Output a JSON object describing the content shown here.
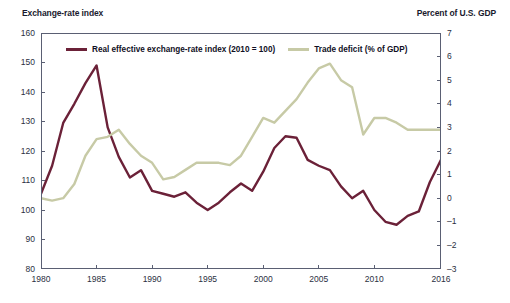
{
  "header": {
    "left_axis_title": "Exchange-rate index",
    "right_axis_title": "Percent of U.S. GDP"
  },
  "legend": {
    "items": [
      {
        "label": "Real effective exchange-rate index (2010 = 100)",
        "color": "#6b2138"
      },
      {
        "label": "Trade deficit (% of GDP)",
        "color": "#c7caa6"
      }
    ]
  },
  "chart_data": {
    "type": "line",
    "title": "",
    "subtitle": "",
    "xlabel": "",
    "ylabel": "Exchange-rate index",
    "y2label": "Percent of U.S. GDP",
    "grid": false,
    "legend_position": "top-inside",
    "xlim": [
      1980,
      2016
    ],
    "ylim": [
      80,
      160
    ],
    "y2lim": [
      -3,
      7
    ],
    "x_ticks": [
      1980,
      1985,
      1990,
      1995,
      2000,
      2005,
      2010,
      2016
    ],
    "x_tick_labels": [
      "1980",
      "1985",
      "1990",
      "1995",
      "2000",
      "2005",
      "2010",
      "2016"
    ],
    "y_ticks": [
      80,
      90,
      100,
      110,
      120,
      130,
      140,
      150,
      160
    ],
    "y_tick_labels": [
      "80",
      "90",
      "100",
      "110",
      "120",
      "130",
      "140",
      "150",
      "160"
    ],
    "y2_ticks": [
      -3,
      -2,
      -1,
      0,
      1,
      2,
      3,
      4,
      5,
      6,
      7
    ],
    "y2_tick_labels": [
      "–3",
      "–2",
      "–1",
      "0",
      "1",
      "2",
      "3",
      "4",
      "5",
      "6",
      "7"
    ],
    "x": [
      1980,
      1981,
      1982,
      1983,
      1984,
      1985,
      1986,
      1987,
      1988,
      1989,
      1990,
      1991,
      1992,
      1993,
      1994,
      1995,
      1996,
      1997,
      1998,
      1999,
      2000,
      2001,
      2002,
      2003,
      2004,
      2005,
      2006,
      2007,
      2008,
      2009,
      2010,
      2011,
      2012,
      2013,
      2014,
      2015,
      2016
    ],
    "series": [
      {
        "name": "Real effective exchange-rate index (2010 = 100)",
        "axis": "left",
        "color": "#6b2138",
        "values": [
          105.5,
          115.0,
          129.5,
          136.0,
          143.0,
          149.0,
          128.0,
          118.0,
          111.0,
          113.5,
          106.5,
          105.5,
          104.5,
          106.0,
          102.5,
          100.0,
          102.5,
          106.0,
          109.0,
          106.5,
          113.0,
          121.0,
          125.0,
          124.5,
          117.0,
          115.0,
          113.5,
          108.0,
          104.0,
          106.5,
          100.0,
          96.0,
          95.0,
          98.0,
          99.5,
          109.5,
          117.0
        ]
      },
      {
        "name": "Trade deficit (% of GDP)",
        "axis": "right",
        "color": "#c7caa6",
        "values": [
          0.0,
          -0.1,
          0.0,
          0.6,
          1.8,
          2.5,
          2.6,
          2.9,
          2.3,
          1.8,
          1.5,
          0.8,
          0.9,
          1.2,
          1.5,
          1.5,
          1.5,
          1.4,
          1.8,
          2.6,
          3.4,
          3.2,
          3.7,
          4.2,
          4.9,
          5.5,
          5.7,
          5.0,
          4.7,
          2.7,
          3.4,
          3.4,
          3.2,
          2.9,
          2.9,
          2.9,
          2.9
        ]
      }
    ]
  }
}
